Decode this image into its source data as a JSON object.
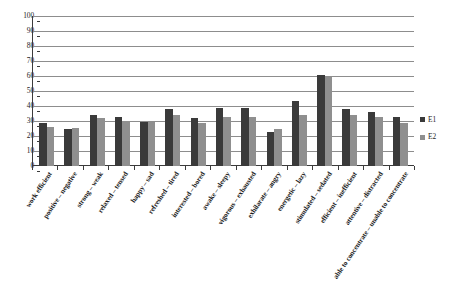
{
  "chart_data": {
    "type": "bar",
    "title": "",
    "xlabel": "",
    "ylabel": "",
    "ylim": [
      0,
      100
    ],
    "ytick_step": 10,
    "grid": true,
    "legend_position": "right",
    "yticks": [
      "100",
      "90",
      "80",
      "70",
      "60",
      "50",
      "40",
      "30",
      "20",
      "10",
      "0"
    ],
    "categories": [
      "work efficient",
      "positive – negative",
      "strong – weak",
      "relaxed – tensed",
      "happy – sad",
      "refreshed – tired",
      "interested – bored",
      "awake – sleepy",
      "vigorous – exhausted",
      "exhilarate – angry",
      "energetic – lazy",
      "stimulated – sedated",
      "efficient – inefficient",
      "attentive – distracted",
      "able to concentrate – unable to concentrate"
    ],
    "series": [
      {
        "name": "E1",
        "color": "#3a3a3a",
        "values": [
          29,
          24.5,
          34,
          33,
          29.5,
          38,
          32,
          38.5,
          39,
          23,
          43.5,
          61,
          38,
          36,
          33
        ]
      },
      {
        "name": "E2",
        "color": "#8f8f8f",
        "values": [
          26,
          25.5,
          32,
          30,
          29.5,
          34,
          28.5,
          33,
          33,
          25,
          34,
          59.5,
          34,
          32.5,
          29
        ]
      }
    ]
  },
  "legend": {
    "items": [
      {
        "label": "E1",
        "color": "#3a3a3a"
      },
      {
        "label": "E2",
        "color": "#8f8f8f"
      }
    ]
  }
}
